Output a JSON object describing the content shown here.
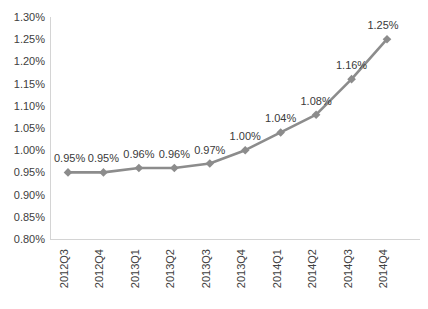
{
  "chart_data": {
    "type": "line",
    "title": "",
    "subtitle": "",
    "xlabel": "",
    "ylabel": "",
    "categories": [
      "2012Q3",
      "2012Q4",
      "2013Q1",
      "2013Q2",
      "2013Q3",
      "2013Q4",
      "2014Q1",
      "2014Q2",
      "2014Q3",
      "2014Q4"
    ],
    "values": [
      0.95,
      0.95,
      0.96,
      0.96,
      0.97,
      1.0,
      1.04,
      1.08,
      1.16,
      1.25
    ],
    "data_labels": [
      "0.95%",
      "0.95%",
      "0.96%",
      "0.96%",
      "0.97%",
      "1.00%",
      "1.04%",
      "1.08%",
      "1.16%",
      "1.25%"
    ],
    "ylim": [
      0.8,
      1.3
    ],
    "ytick_values": [
      1.3,
      1.25,
      1.2,
      1.15,
      1.1,
      1.05,
      1.0,
      0.95,
      0.9,
      0.85,
      0.8
    ],
    "ytick_labels": [
      "1.30%",
      "1.25%",
      "1.20%",
      "1.15%",
      "1.10%",
      "1.05%",
      "1.00%",
      "0.95%",
      "0.90%",
      "0.85%",
      "0.80%"
    ],
    "grid": false,
    "legend": false,
    "legend_position": "none",
    "series": [
      {
        "name": "",
        "values": [
          0.95,
          0.95,
          0.96,
          0.96,
          0.97,
          1.0,
          1.04,
          1.08,
          1.16,
          1.25
        ],
        "color": "#8c8c8c",
        "marker": "diamond"
      }
    ],
    "colors": {
      "line": "#8c8c8c",
      "marker": "#8c8c8c",
      "axis": "#d4d4d4",
      "tick_text": "#404040",
      "label_text": "#3a3a3a",
      "background": "#ffffff"
    },
    "xtick_rotation": -90
  }
}
